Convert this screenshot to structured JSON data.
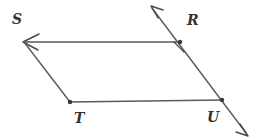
{
  "figure": {
    "type": "geometry-diagram",
    "shape": "parallelogram",
    "background_color": "#ffffff",
    "stroke_color": "#4d4d4d",
    "label_color": "#333333",
    "vertices": [
      {
        "id": "S",
        "label": "S",
        "x": 24,
        "y": 42,
        "label_x": 12,
        "label_y": 12,
        "dot": false
      },
      {
        "id": "R",
        "label": "R",
        "x": 180,
        "y": 42,
        "label_x": 187,
        "label_y": 13,
        "dot": true
      },
      {
        "id": "T",
        "label": "T",
        "x": 70,
        "y": 102,
        "label_x": 74,
        "label_y": 111,
        "dot": true
      },
      {
        "id": "U",
        "label": "U",
        "x": 222,
        "y": 100,
        "label_x": 207,
        "label_y": 110,
        "dot": true
      }
    ],
    "segments": [
      {
        "id": "SR",
        "from": "S",
        "to": "R",
        "x1": 24,
        "y1": 42,
        "x2": 180,
        "y2": 42,
        "arrow_at_start": true
      },
      {
        "id": "ST",
        "from": "S",
        "to": "T",
        "x1": 24,
        "y1": 42,
        "x2": 70,
        "y2": 102,
        "arrow_at_start": false
      },
      {
        "id": "TU",
        "from": "T",
        "to": "U",
        "x1": 70,
        "y1": 102,
        "x2": 222,
        "y2": 100,
        "arrow_at_start": false
      },
      {
        "id": "ray-RU",
        "from": "above-R",
        "to": "below-U",
        "x1": 152,
        "y1": 6,
        "x2": 247,
        "y2": 135,
        "arrow_at_start": true,
        "arrow_at_end": true
      }
    ],
    "tick_marks": [
      {
        "id": "tick-R",
        "on_segment": "ray-RU",
        "x": 180,
        "y": 45,
        "angle_deg": 35
      }
    ]
  }
}
